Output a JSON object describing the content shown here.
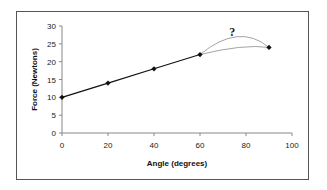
{
  "chart_data": {
    "type": "line",
    "title": "",
    "xlabel": "Angle (degrees)",
    "ylabel": "Force (Newtons)",
    "xlim": [
      0,
      100
    ],
    "ylim": [
      0,
      30
    ],
    "x_ticks": [
      0,
      20,
      40,
      60,
      80,
      100
    ],
    "y_ticks": [
      0,
      5,
      10,
      15,
      20,
      25,
      30
    ],
    "grid": false,
    "legend": null,
    "series": [
      {
        "name": "measured",
        "x": [
          0,
          20,
          40,
          60,
          90
        ],
        "y": [
          10,
          14,
          18,
          22,
          24
        ],
        "style": "solid-with-markers"
      }
    ],
    "speculative_curves": [
      {
        "name": "upper-guess",
        "x": [
          60,
          76,
          90
        ],
        "y": [
          22,
          27,
          24
        ],
        "style": "thin-gray-curve"
      },
      {
        "name": "lower-guess",
        "x": [
          60,
          77,
          90
        ],
        "y": [
          22,
          24,
          24
        ],
        "style": "thin-gray-curve"
      }
    ],
    "annotations": [
      {
        "text": "?",
        "x": 74,
        "y": 28
      }
    ]
  },
  "labels": {
    "x_axis_title": "Angle (degrees)",
    "y_axis_title": "Force (Newtons)",
    "annotation": "?"
  },
  "colors": {
    "line": "#111111",
    "guess": "#999999",
    "frame": "#555555"
  }
}
